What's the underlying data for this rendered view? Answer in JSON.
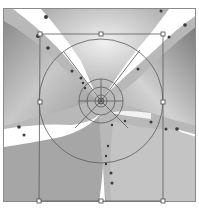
{
  "canvas": {
    "background": "#ffffff",
    "photo": {
      "description": "grayscale leaf-like lobes with white X-shaped gaps",
      "tones": {
        "light": "#e6e6e6",
        "mid": "#b4b4b4",
        "dark": "#7c7c7c",
        "gap": "#ffffff",
        "spots": "#3a3a3a"
      }
    },
    "transform_box": {
      "color": "#5a5a5a",
      "handles": [
        {
          "name": "top-left",
          "x": 40,
          "y": 34
        },
        {
          "name": "top-middle",
          "x": 101,
          "y": 34
        },
        {
          "name": "top-right",
          "x": 163,
          "y": 34
        },
        {
          "name": "middle-left",
          "x": 40,
          "y": 102
        },
        {
          "name": "middle-right",
          "x": 163,
          "y": 102
        },
        {
          "name": "bottom-left",
          "x": 39,
          "y": 201
        },
        {
          "name": "bottom-middle",
          "x": 101,
          "y": 201
        },
        {
          "name": "bottom-right",
          "x": 163,
          "y": 201
        }
      ]
    },
    "polar_grid": {
      "center": {
        "x": 101,
        "y": 101
      },
      "radii": [
        6,
        14,
        22,
        62
      ],
      "spokes_deg": [
        -125,
        -55,
        55,
        125,
        180,
        0
      ]
    }
  }
}
